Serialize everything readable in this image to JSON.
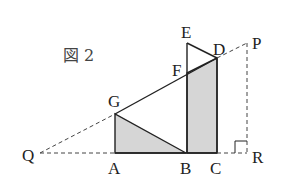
{
  "figure": {
    "title": "図 2",
    "points": {
      "Q": "Q",
      "A": "A",
      "B": "B",
      "C": "C",
      "R": "R",
      "G": "G",
      "F": "F",
      "D": "D",
      "E": "E",
      "P": "P"
    },
    "shaded_regions": [
      "triangle GAB",
      "quadrilateral FBCD"
    ],
    "dashed_segments": [
      "QG",
      "QA",
      "DP",
      "PR",
      "CR"
    ],
    "solid_segments": [
      "GD",
      "GA",
      "GB",
      "AB",
      "BC",
      "EB",
      "EC-side ED",
      "DC"
    ],
    "right_angle_at": "R",
    "fill_color": "#d6d6d6",
    "line_color": "#222222"
  }
}
